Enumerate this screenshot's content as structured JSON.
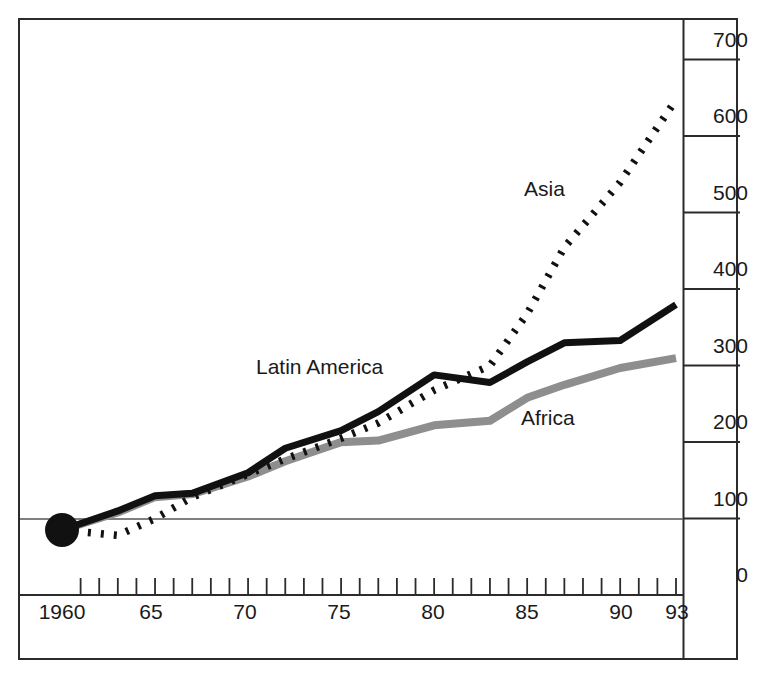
{
  "chart_data": {
    "type": "line",
    "title": "",
    "subtitle": "",
    "xlabel": "",
    "ylabel": "",
    "xlim": [
      1960,
      1993
    ],
    "ylim": [
      0,
      700
    ],
    "grid": false,
    "legend_position": "inline-annotations",
    "y_ticks": [
      0,
      100,
      200,
      300,
      400,
      500,
      600,
      700
    ],
    "y_tick_labels": [
      "0",
      "100",
      "200",
      "300",
      "400",
      "500",
      "600",
      "700"
    ],
    "x_ticks": [
      1960,
      1965,
      1970,
      1975,
      1980,
      1985,
      1990,
      1993
    ],
    "x_tick_labels": [
      "1960",
      "65",
      "70",
      "75",
      "80",
      "85",
      "90",
      "93"
    ],
    "x_minor_tick_years": [
      1961,
      1962,
      1963,
      1964,
      1965,
      1966,
      1967,
      1968,
      1969,
      1970,
      1971,
      1972,
      1973,
      1974,
      1975,
      1976,
      1977,
      1978,
      1979,
      1980,
      1981,
      1982,
      1983,
      1984,
      1985,
      1986,
      1987,
      1988,
      1989,
      1990,
      1991,
      1992,
      1993
    ],
    "reference_line": {
      "value": 85,
      "label": "",
      "color": "#555555"
    },
    "origin_marker": {
      "x": 1960,
      "y": 85,
      "shape": "filled-circle",
      "radius": 17,
      "color": "#111111"
    },
    "x": [
      1960,
      1963,
      1965,
      1967,
      1970,
      1972,
      1975,
      1977,
      1980,
      1983,
      1985,
      1987,
      1990,
      1993
    ],
    "series": [
      {
        "name": "Asia",
        "style": "dotted",
        "color": "#111111",
        "values": [
          85,
          78,
          100,
          128,
          158,
          178,
          205,
          225,
          268,
          300,
          368,
          455,
          540,
          648
        ]
      },
      {
        "name": "Latin America",
        "style": "solid",
        "color": "#111111",
        "values": [
          85,
          110,
          130,
          133,
          160,
          192,
          215,
          240,
          288,
          278,
          305,
          330,
          333,
          380
        ]
      },
      {
        "name": "Africa",
        "style": "solid",
        "color": "#8e8e8e",
        "values": [
          85,
          108,
          128,
          132,
          155,
          175,
          200,
          202,
          222,
          228,
          258,
          275,
          297,
          310
        ]
      }
    ]
  },
  "axis": {
    "y_labels": [
      "700",
      "600",
      "500",
      "400",
      "300",
      "200",
      "100",
      "0"
    ],
    "x_labels": [
      "1960",
      "65",
      "70",
      "75",
      "80",
      "85",
      "90",
      "93"
    ]
  },
  "annotations": {
    "asia": "Asia",
    "latin_america": "Latin America",
    "africa": "Africa"
  }
}
